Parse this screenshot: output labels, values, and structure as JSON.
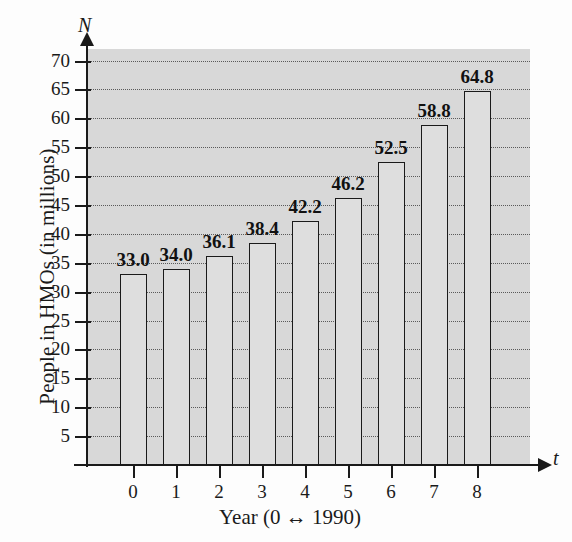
{
  "chart_data": {
    "type": "bar",
    "title": "",
    "xlabel": "Year (0 ↔ 1990)",
    "ylabel": "People in HMOs (in millions)",
    "x_axis_variable": "t",
    "y_axis_variable": "N",
    "categories": [
      "0",
      "1",
      "2",
      "3",
      "4",
      "5",
      "6",
      "7",
      "8"
    ],
    "values": [
      33.0,
      34.0,
      36.1,
      38.4,
      42.2,
      46.2,
      52.5,
      58.8,
      64.8
    ],
    "value_labels": [
      "33.0",
      "34.0",
      "36.1",
      "38.4",
      "42.2",
      "46.2",
      "52.5",
      "58.8",
      "64.8"
    ],
    "ylim": [
      0,
      72
    ],
    "xlim": [
      -0.6,
      8.9
    ],
    "ytick_labels": [
      "5",
      "10",
      "15",
      "20",
      "25",
      "30",
      "35",
      "40",
      "45",
      "50",
      "55",
      "60",
      "65",
      "70"
    ],
    "ytick_values": [
      5,
      10,
      15,
      20,
      25,
      30,
      35,
      40,
      45,
      50,
      55,
      60,
      65,
      70
    ],
    "grid": true,
    "grid_style": "dotted-horizontal",
    "legend": "none",
    "colors": {
      "bar_fill": "#dedede",
      "bar_border": "#1a1a1a",
      "plot_background": "#d8d8d8",
      "page_background": "#fdfdfd",
      "axis": "#1a1a1a",
      "gridline": "#5a5a5a"
    }
  }
}
